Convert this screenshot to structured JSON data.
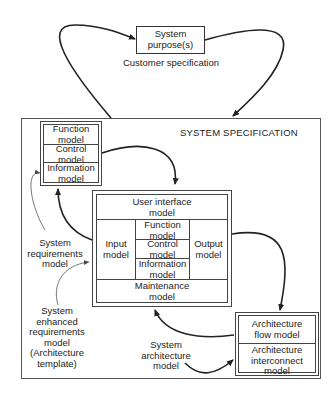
{
  "diagram": {
    "title": "SYSTEM SPECIFICATION",
    "purpose_box": {
      "label": "System\npurpose(s)",
      "caption": "Customer specification"
    },
    "requirements_box": {
      "cells": [
        "Function\nmodel",
        "Control\nmodel",
        "Information\nmodel"
      ]
    },
    "enhanced_box": {
      "top": "User interface\nmodel",
      "left": "Input\nmodel",
      "middle": [
        "Function\nmodel",
        "Control\nmodel",
        "Information\nmodel"
      ],
      "right": "Output\nmodel",
      "bottom": "Maintenance\nmodel"
    },
    "architecture_box": {
      "cells": [
        "Architecture\nflow model",
        "Architecture\ninterconnect\nmodel"
      ]
    },
    "annotations": {
      "requirements": "System\nrequirements\nmodel",
      "enhanced": "System\nenhanced\nrequirements\nmodel\n(Architecture\ntemplate)",
      "architecture": "System\narchitecture\nmodel"
    },
    "colors": {
      "line": "#222222",
      "thin_line": "#555555",
      "background": "#ffffff"
    }
  }
}
